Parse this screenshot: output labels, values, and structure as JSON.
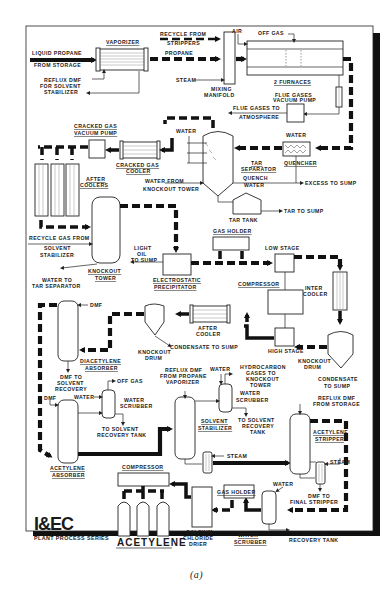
{
  "diagram": {
    "publisher_logo": "I&EC",
    "series_label": "PLANT PROCESS SERIES",
    "product_label": "ACETYLENE",
    "caption": "(a)",
    "labels": {
      "liquid_propane": "LIQUID PROPANE",
      "from_storage": "FROM STORAGE",
      "vaporizer": "VAPORIZER",
      "reflux_dmf_1": "REFLUX DMF",
      "reflux_dmf_2": "FOR SOLVENT",
      "reflux_dmf_3": "STABILIZER",
      "recycle_from_1": "RECYCLE FROM",
      "recycle_from_2": "STRIPPERS",
      "propane": "PROPANE",
      "steam_1": "STEAM",
      "mixing_1": "MIXING",
      "mixing_2": "MANIFOLD",
      "air": "AIR",
      "off_gas_1": "OFF GAS",
      "furnaces": "2 FURNACES",
      "flue_pump_1": "FLUE GASES",
      "flue_pump_2": "VACUUM PUMP",
      "flue_atm_1": "FLUE GASES TO",
      "flue_atm_2": "ATMOSPHERE",
      "cg_pump_1": "CRACKED GAS",
      "cg_pump_2": "VACUUM PUMP",
      "cg_cooler_1": "CRACKED GAS",
      "cg_cooler_2": "COOLER",
      "water_1": "WATER",
      "water_2": "WATER",
      "tar_sep_1": "TAR",
      "tar_sep_2": "SEPARATOR",
      "quencher": "QUENCHER",
      "after_coolers_1": "AFTER",
      "after_coolers_2": "COOLERS",
      "water_from_ko_1": "WATER FROM",
      "water_from_ko_2": "KNOCKOUT TOWER",
      "quench_water_1": "QUENCH",
      "quench_water_2": "WATER",
      "excess_sump": "EXCESS TO SUMP",
      "tar_tank": "TAR TANK",
      "tar_sump": "TAR TO SUMP",
      "recycle_gas_1": "RECYCLE GAS FROM",
      "recycle_gas_2": "SOLVENT",
      "recycle_gas_3": "STABILIZER",
      "light_oil_1": "LIGHT",
      "light_oil_2": "OIL",
      "light_oil_3": "TO SUMP",
      "water_to_tar_1": "WATER TO",
      "water_to_tar_2": "TAR SEPARATOR",
      "ko_tower_1": "KNOCKOUT",
      "ko_tower_2": "TOWER",
      "esp_1": "ELECTROSTATIC",
      "esp_2": "PRECIPITATOR",
      "gas_holder_1": "GAS HOLDER",
      "low_stage": "LOW STAGE",
      "compressor_1": "COMPRESSOR",
      "inter_cooler_1": "INTER",
      "inter_cooler_2": "COOLER",
      "high_stage": "HIGH STAGE",
      "after_cooler_1": "AFTER",
      "after_cooler_2": "COOLER",
      "ko_drum_a_1": "KNOCKOUT",
      "ko_drum_a_2": "DRUM",
      "condensate_a": "CONDENSATE TO SUMP",
      "ko_drum_b_1": "KNOCKOUT",
      "ko_drum_b_2": "DRUM",
      "condensate_b_1": "CONDENSATE",
      "condensate_b_2": "TO SUMP",
      "dmf_1": "DMF",
      "diacetylene_1": "DIACETYLENE",
      "diacetylene_2": "ABSORBER",
      "dmf_recovery_1": "DMF TO",
      "dmf_recovery_2": "SOLVENT",
      "dmf_recovery_3": "RECOVERY",
      "off_gas_2": "OFF GAS",
      "water_3": "WATER",
      "water_scrubber_1a": "WATER",
      "water_scrubber_1b": "SCRUBBER",
      "to_solvent_1a": "TO SOLVENT",
      "to_solvent_1b": "RECOVERY TANK",
      "dmf_2": "DMF",
      "acetylene_abs_1": "ACETYLENE",
      "acetylene_abs_2": "ABSORBER",
      "reflux_prop_1": "REFLUX DMF",
      "reflux_prop_2": "FROM PROPANE",
      "reflux_prop_3": "VAPORIZER",
      "water_4": "WATER",
      "hydrocarbon_1": "HYDROCARBON",
      "hydrocarbon_2": "GASES TO",
      "hydrocarbon_3": "KNOCKOUT",
      "hydrocarbon_4": "TOWER",
      "water_scrubber_2a": "WATER",
      "water_scrubber_2b": "SCRUBBER",
      "to_solvent_2a": "TO SOLVENT",
      "to_solvent_2b": "RECOVERY",
      "to_solvent_2c": "TANK",
      "solvent_stab_1": "SOLVENT",
      "solvent_stab_2": "STABILIZER",
      "steam_2": "STEAM",
      "reflux_storage_1": "REFLUX DMF",
      "reflux_storage_2": "FROM STORAGE",
      "acetylene_strip_1": "ACETYLENE",
      "acetylene_strip_2": "STRIPPER",
      "steam_3": "STEAM",
      "water_5": "WATER",
      "dmf_final_1": "DMF TO",
      "dmf_final_2": "FINAL STRIPPER",
      "compressor_2": "COMPRESSOR",
      "gas_holder_2": "GAS HOLDER",
      "cacl_1": "CALCIUM",
      "cacl_2": "CHLORIDE",
      "cacl_3": "DRIER",
      "water_scrubber_3a": "WATER",
      "water_scrubber_3b": "SCRUBBER",
      "to_solvent_3a": "TO SOLVENT",
      "to_solvent_3b": "RECOVERY TANK"
    },
    "colors": {
      "line": "#111111",
      "equipment_fill": "#ffffff",
      "background": "#ffffff",
      "frame_shadow": "#111111"
    }
  }
}
